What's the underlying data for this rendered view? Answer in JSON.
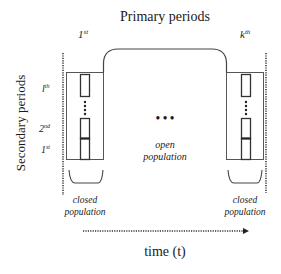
{
  "title": "Primary periods",
  "y_axis_label": "Secondary periods",
  "x_axis_label": "time (t)",
  "primary_labels": {
    "first": {
      "base": "1",
      "sup": "st"
    },
    "last": {
      "base": "k",
      "sup": "th"
    }
  },
  "secondary_labels": [
    {
      "base": "l",
      "sup": "th"
    },
    {
      "base": "2",
      "sup": "nd"
    },
    {
      "base": "1",
      "sup": "st"
    }
  ],
  "middle": {
    "ellipsis": "• • •",
    "label_line1": "open",
    "label_line2": "population"
  },
  "closed_label": {
    "line1": "closed",
    "line2": "population"
  },
  "colors": {
    "line": "#3a3a3a",
    "text": "#1a1a1a",
    "background": "#ffffff"
  }
}
